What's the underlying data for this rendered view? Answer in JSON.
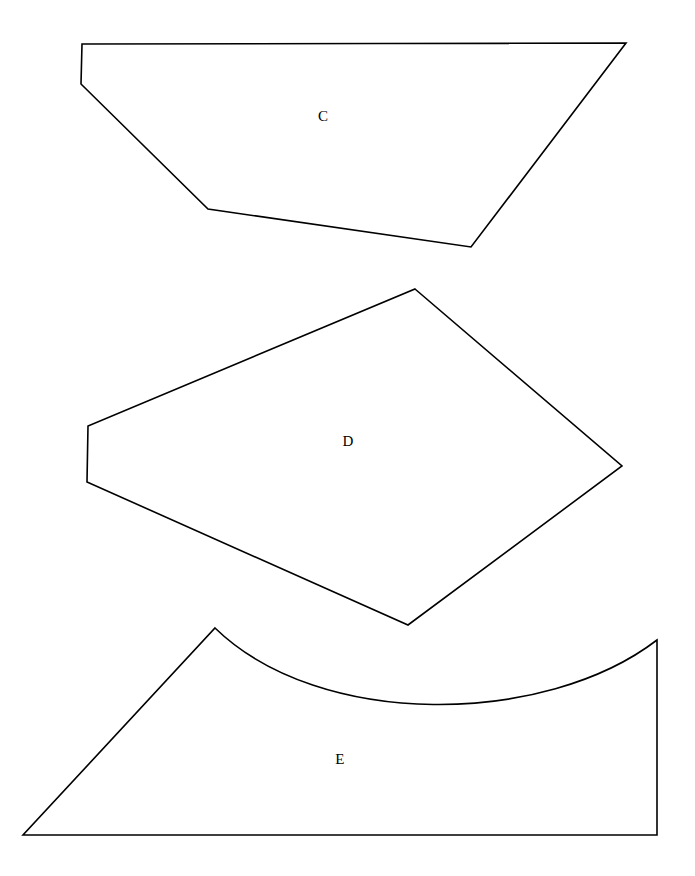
{
  "figure": {
    "background_color": "#ffffff",
    "stroke_color": "#000000",
    "stroke_width": 1.6,
    "canvas": {
      "width": 695,
      "height": 876
    },
    "shape_count": 3
  },
  "shapes": [
    {
      "id": "shape-c",
      "label": "C",
      "kind": "polygon",
      "sides": 5,
      "description": "Irregular convex quadrilateral-like pentagon, wide flat top edge",
      "label_position": {
        "x": 323,
        "y": 118
      },
      "vertices": [
        {
          "x": 82,
          "y": 44
        },
        {
          "x": 626,
          "y": 43
        },
        {
          "x": 471,
          "y": 247
        },
        {
          "x": 208,
          "y": 209
        },
        {
          "x": 81,
          "y": 84
        }
      ],
      "path": "M 82 44 L 626 43 L 471 247 L 208 209 L 81 84 Z"
    },
    {
      "id": "shape-d",
      "label": "D",
      "kind": "polygon",
      "sides": 5,
      "description": "Irregular pentagon resembling a tilted kite with a short vertical left edge",
      "label_position": {
        "x": 348,
        "y": 443
      },
      "vertices": [
        {
          "x": 415,
          "y": 289
        },
        {
          "x": 622,
          "y": 466
        },
        {
          "x": 408,
          "y": 625
        },
        {
          "x": 87,
          "y": 482
        },
        {
          "x": 88,
          "y": 426
        }
      ],
      "path": "M 415 289 L 622 466 L 408 625 L 87 482 L 88 426 Z"
    },
    {
      "id": "shape-e",
      "label": "E",
      "kind": "curved-polygon",
      "sides": 4,
      "description": "Quadrilateral with a concave curved upper edge dipping between the left peak and the right top corner",
      "label_position": {
        "x": 340,
        "y": 761
      },
      "vertices": [
        {
          "x": 215,
          "y": 628
        },
        {
          "x": 657,
          "y": 640
        },
        {
          "x": 657,
          "y": 835
        },
        {
          "x": 23,
          "y": 835
        }
      ],
      "curve": {
        "from": {
          "x": 215,
          "y": 628
        },
        "to": {
          "x": 657,
          "y": 640
        },
        "lowest_point": {
          "x": 433,
          "y": 712
        },
        "control_points": [
          {
            "x": 320,
            "y": 730
          },
          {
            "x": 545,
            "y": 726
          }
        ]
      },
      "path": "M 215 628 C 320 730 545 726 657 640 L 657 835 L 23 835 Z"
    }
  ]
}
